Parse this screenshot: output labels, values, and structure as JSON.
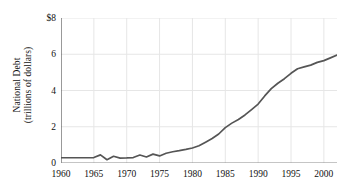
{
  "chart_data": {
    "type": "line",
    "title": "",
    "xlabel": "",
    "ylabel": "National Debt (trillions of dollars)",
    "ylabel_line1": "National Debt",
    "ylabel_line2": "(trillions of dollars)",
    "xlim": [
      1960,
      2002
    ],
    "ylim": [
      0,
      8
    ],
    "grid": true,
    "legend": "none",
    "x_tick_labels": [
      "1960",
      "1965",
      "1970",
      "1975",
      "1980",
      "1985",
      "1990",
      "1995",
      "2000"
    ],
    "x_ticks": [
      1960,
      1965,
      1970,
      1975,
      1980,
      1985,
      1990,
      1995,
      2000
    ],
    "x_minor_ticks": [
      1962.5,
      1967.5,
      1972.5,
      1977.5,
      1982.5,
      1987.5,
      1992.5,
      1997.5
    ],
    "y_tick_labels": [
      "0",
      "2",
      "4",
      "6",
      "$8"
    ],
    "y_ticks": [
      0,
      2,
      4,
      6,
      8
    ],
    "y_minor_ticks": [
      1,
      3,
      5,
      7
    ],
    "y_axis_unit_prefix": "$",
    "series": [
      {
        "name": "National Debt",
        "color": "#555555",
        "x": [
          1960,
          1961,
          1962,
          1963,
          1964,
          1965,
          1966,
          1967,
          1968,
          1969,
          1970,
          1971,
          1972,
          1973,
          1974,
          1975,
          1976,
          1977,
          1978,
          1979,
          1980,
          1981,
          1982,
          1983,
          1984,
          1985,
          1986,
          1987,
          1988,
          1989,
          1990,
          1991,
          1992,
          1993,
          1994,
          1995,
          1996,
          1997,
          1998,
          1999,
          2000,
          2001,
          2002
        ],
        "values": [
          0.29,
          0.29,
          0.29,
          0.29,
          0.29,
          0.3,
          0.45,
          0.18,
          0.37,
          0.27,
          0.28,
          0.3,
          0.44,
          0.33,
          0.49,
          0.39,
          0.54,
          0.62,
          0.68,
          0.75,
          0.83,
          0.95,
          1.15,
          1.35,
          1.6,
          1.95,
          2.2,
          2.4,
          2.65,
          2.95,
          3.25,
          3.7,
          4.1,
          4.4,
          4.65,
          4.95,
          5.2,
          5.3,
          5.4,
          5.55,
          5.65,
          5.8,
          5.95
        ]
      }
    ]
  },
  "axes": {
    "y_axis_name": "national-debt-trillions",
    "x_axis_name": "year"
  }
}
